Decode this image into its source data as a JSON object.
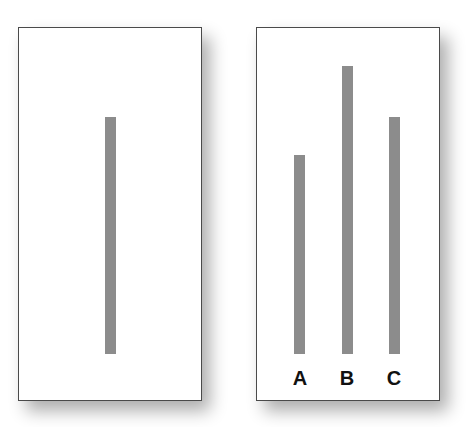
{
  "diagram": {
    "type": "asch-line-judgment",
    "line_color": "#8c8c8c",
    "border_color": "#4a4a4a",
    "standard_card": {
      "lines": [
        {
          "id": "standard",
          "label": "",
          "x": 87,
          "top": 89,
          "height": 237
        }
      ]
    },
    "comparison_card": {
      "lines": [
        {
          "id": "A",
          "label": "A",
          "x": 38,
          "top": 128,
          "height": 198
        },
        {
          "id": "B",
          "label": "B",
          "x": 86,
          "top": 39,
          "height": 287
        },
        {
          "id": "C",
          "label": "C",
          "x": 133,
          "top": 89,
          "height": 237
        }
      ]
    }
  }
}
